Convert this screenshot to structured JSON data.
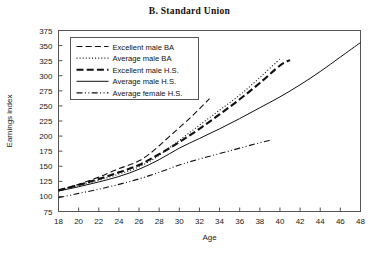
{
  "chart_data": {
    "type": "line",
    "title": "B.  Standard Union",
    "xlabel": "Age",
    "ylabel": "Earnings index",
    "xlim": [
      18,
      48
    ],
    "ylim": [
      75,
      375
    ],
    "xticks": [
      18,
      20,
      22,
      24,
      26,
      28,
      30,
      32,
      34,
      36,
      38,
      40,
      42,
      44,
      46,
      48
    ],
    "yticks": [
      75,
      100,
      125,
      150,
      175,
      200,
      225,
      250,
      275,
      300,
      325,
      350,
      375
    ],
    "grid": false,
    "legend_position": "upper-left",
    "series": [
      {
        "name": "Excellent male BA",
        "style": "dashed",
        "x": [
          18,
          20,
          22,
          23,
          24,
          25,
          26,
          27,
          28,
          29,
          30,
          31,
          32,
          33
        ],
        "y": [
          110,
          120,
          132,
          139,
          146,
          152,
          159,
          170,
          184,
          199,
          214,
          229,
          245,
          262
        ]
      },
      {
        "name": "Average male BA",
        "style": "dotted",
        "x": [
          18,
          20,
          22,
          24,
          26,
          28,
          30,
          32,
          34,
          36,
          38,
          40
        ],
        "y": [
          110,
          118,
          127,
          137,
          149,
          168,
          193,
          218,
          243,
          268,
          297,
          328
        ]
      },
      {
        "name": "Excellent male H.S.",
        "style": "bold-dash",
        "x": [
          18,
          20,
          22,
          24,
          26,
          28,
          30,
          32,
          34,
          36,
          38,
          40,
          41
        ],
        "y": [
          110,
          119,
          129,
          140,
          152,
          170,
          190,
          212,
          236,
          261,
          288,
          317,
          326
        ]
      },
      {
        "name": "Average male H.S.",
        "style": "solid",
        "x": [
          18,
          20,
          22,
          24,
          26,
          28,
          30,
          32,
          34,
          36,
          38,
          40,
          42,
          44,
          46,
          48
        ],
        "y": [
          109,
          116,
          124,
          133,
          145,
          161,
          180,
          196,
          212,
          229,
          247,
          265,
          285,
          307,
          331,
          355
        ]
      },
      {
        "name": "Average female H.S.",
        "style": "dash-dot-dot",
        "x": [
          18,
          20,
          22,
          24,
          26,
          28,
          30,
          32,
          34,
          36,
          38,
          39
        ],
        "y": [
          98,
          105,
          112,
          120,
          129,
          140,
          152,
          162,
          171,
          180,
          189,
          193
        ]
      }
    ]
  },
  "axes": {
    "x_axis_title": "Age",
    "y_axis_title": "Earnings index"
  },
  "legend": {
    "items": [
      {
        "label": "Excellent male BA"
      },
      {
        "label": "Average male BA"
      },
      {
        "label": "Excellent male H.S."
      },
      {
        "label": "Average male H.S."
      },
      {
        "label": "Average female H.S."
      }
    ]
  }
}
